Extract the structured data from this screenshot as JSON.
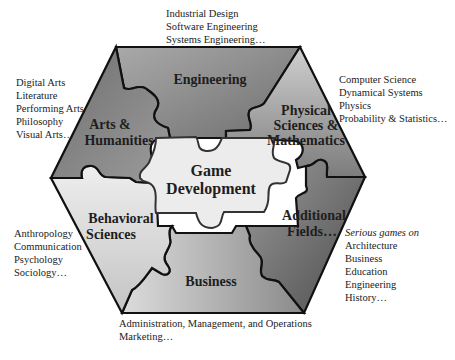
{
  "diagram": {
    "center": {
      "line1": "Game",
      "line2": "Development"
    },
    "segments": [
      {
        "id": "engineering",
        "label_lines": [
          "Engineering"
        ],
        "fill": "#8c8c8c"
      },
      {
        "id": "physical",
        "label_lines": [
          "Physical",
          "Sciences &",
          "Mathematics"
        ],
        "fill": "#9e9e9e"
      },
      {
        "id": "additional",
        "label_lines": [
          "Additional",
          "Fields…"
        ],
        "fill": "#7a7a7a"
      },
      {
        "id": "business",
        "label_lines": [
          "Business"
        ],
        "fill": "#a8a8a8"
      },
      {
        "id": "behavioral",
        "label_lines": [
          "Behavioral",
          "Sciences"
        ],
        "fill": "#d6d6d6"
      },
      {
        "id": "arts",
        "label_lines": [
          "Arts &",
          "Humanities"
        ],
        "fill": "#7e7e7e"
      }
    ],
    "lists": {
      "engineering": [
        "Industrial Design",
        "Software Engineering",
        "Systems Engineering…"
      ],
      "arts": [
        "Digital Arts",
        "Literature",
        "Performing Arts",
        "Philosophy",
        "Visual Arts…"
      ],
      "physical": [
        "Computer Science",
        "Dynamical Systems",
        "Physics",
        "Probability & Statistics…"
      ],
      "behavioral": [
        "Anthropology",
        "Communication",
        "Psychology",
        "Sociology…"
      ],
      "additional_heading": "Serious games on",
      "additional": [
        "Architecture",
        "Business",
        "Education",
        "Engineering",
        "History…"
      ],
      "business": [
        "Administration, Management, and Operations",
        "Marketing…"
      ]
    },
    "colors": {
      "outline": "#111111",
      "center_fill": "#ececec"
    }
  }
}
